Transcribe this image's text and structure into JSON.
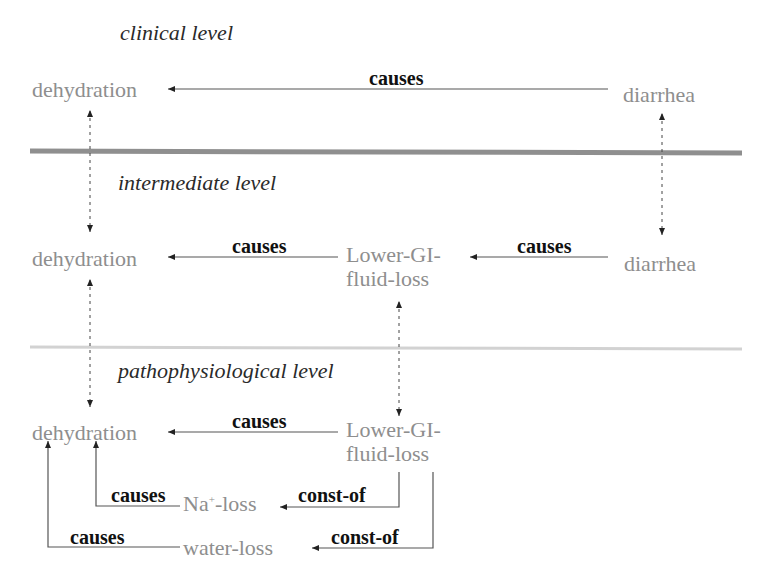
{
  "colors": {
    "concept_text": "#8e8e8e",
    "relation_text": "#111111",
    "level_title_text": "#2a2a2a",
    "arrow_line": "#555555",
    "divider_thick": "#8f8f8f",
    "divider_thin": "#cfcfcf"
  },
  "levels": {
    "clinical": {
      "title": "clinical level",
      "concepts": {
        "dehydration": "dehydration",
        "diarrhea": "diarrhea"
      },
      "relations": {
        "diarrhea_to_dehydration": "causes"
      }
    },
    "intermediate": {
      "title": "intermediate level",
      "concepts": {
        "dehydration": "dehydration",
        "lower_gi_line1": "Lower-GI-",
        "lower_gi_line2": "fluid-loss",
        "diarrhea": "diarrhea"
      },
      "relations": {
        "lowergi_to_dehydration": "causes",
        "diarrhea_to_lowergi": "causes"
      }
    },
    "pathophysiological": {
      "title": "pathophysiological level",
      "concepts": {
        "dehydration": "dehydration",
        "lower_gi_line1": "Lower-GI-",
        "lower_gi_line2": "fluid-loss",
        "na_loss_prefix": "Na",
        "na_loss_sup": "+",
        "na_loss_suffix": "-loss",
        "water_loss": "water-loss"
      },
      "relations": {
        "lowergi_to_dehydration": "causes",
        "naloss_to_dehydration": "causes",
        "lowergi_naloss": "const-of",
        "waterloss_to_dehydration": "causes",
        "lowergi_waterloss": "const-of"
      }
    }
  }
}
